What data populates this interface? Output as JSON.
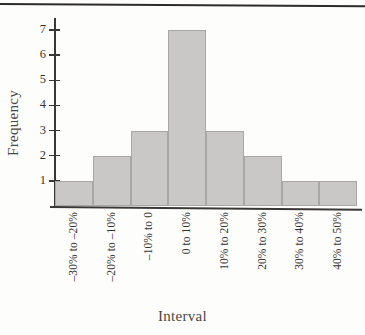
{
  "figure": {
    "background_color": "#fdfdfc",
    "rule_color": "#2e2c2b"
  },
  "chart_data": {
    "type": "bar",
    "title": "",
    "xlabel": "Interval",
    "ylabel": "Frequency",
    "categories": [
      "–30% to –20%",
      "–20% to –10%",
      "–10% to 0",
      "0 to 10%",
      "10% to 20%",
      "20% to 30%",
      "30% to 40%",
      "40% to 50%"
    ],
    "values": [
      1,
      2,
      3,
      7,
      3,
      2,
      1,
      1
    ],
    "ylim": [
      0,
      7.4
    ],
    "yticks": [
      1,
      2,
      3,
      4,
      5,
      6,
      7
    ],
    "ytick_labels": [
      "1",
      "2",
      "3",
      "4",
      "5",
      "6",
      "7"
    ],
    "grid": false,
    "legend": null,
    "bar_fill_color": "#c9c8c6",
    "bar_edge_color": "#a8a7a4",
    "axis_color": "#3a3836"
  }
}
